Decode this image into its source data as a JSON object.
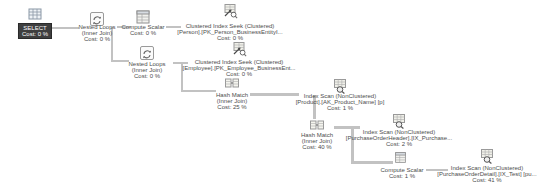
{
  "plan": {
    "colors": {
      "canvas_bg": "#ffffff",
      "connector": "#c2c2c2",
      "selected_bg": "#3f3f3f",
      "selected_text": "#ffffff",
      "label_text": "#4d4d4d"
    },
    "nodes": [
      {
        "id": "select",
        "icon": "result-grid-icon",
        "shape": "grid",
        "selected": true,
        "icon_x": 27,
        "icon_y": 6,
        "label_cx": 35,
        "label_y": 23,
        "lines": [
          "SELECT",
          "Cost: 0 %"
        ]
      },
      {
        "id": "nested-loops-1",
        "icon": "nested-loops-icon",
        "shape": "loops",
        "selected": false,
        "icon_x": 89,
        "icon_y": 11,
        "label_cx": 97,
        "label_y": 24,
        "lines": [
          "Nested Loops",
          "(Inner Join)",
          "Cost: 0 %"
        ]
      },
      {
        "id": "compute-scalar-1",
        "icon": "compute-scalar-icon",
        "shape": "scalar",
        "selected": false,
        "icon_x": 135,
        "icon_y": 9,
        "label_cx": 143,
        "label_y": 24,
        "lines": [
          "Compute Scalar",
          "Cost: 0 %"
        ]
      },
      {
        "id": "clustered-index-seek-person",
        "icon": "clustered-index-seek-icon",
        "shape": "seek",
        "selected": false,
        "icon_x": 222,
        "icon_y": 3,
        "label_cx": 230,
        "label_y": 23,
        "lines": [
          "Clustered Index Seek (Clustered)",
          "[Person].[PK_Person_BusinessEntityI...",
          "Cost: 0 %"
        ]
      },
      {
        "id": "nested-loops-2",
        "icon": "nested-loops-icon",
        "shape": "loops",
        "selected": false,
        "icon_x": 139,
        "icon_y": 45,
        "label_cx": 147,
        "label_y": 61,
        "lines": [
          "Nested Loops",
          "(Inner Join)",
          "Cost: 0 %"
        ]
      },
      {
        "id": "clustered-index-seek-employee",
        "icon": "clustered-index-seek-icon",
        "shape": "seek",
        "selected": false,
        "icon_x": 231,
        "icon_y": 41,
        "label_cx": 239,
        "label_y": 59,
        "lines": [
          "Clustered Index Seek (Clustered)",
          "[Employee].[PK_Employee_BusinessEnt...",
          "Cost: 0 %"
        ]
      },
      {
        "id": "hash-match-1",
        "icon": "hash-match-icon",
        "shape": "hash",
        "selected": false,
        "icon_x": 224,
        "icon_y": 75,
        "label_cx": 232,
        "label_y": 92,
        "lines": [
          "Hash Match",
          "(Inner Join)",
          "Cost: 25 %"
        ]
      },
      {
        "id": "index-scan-product",
        "icon": "index-scan-icon",
        "shape": "scan",
        "selected": false,
        "icon_x": 332,
        "icon_y": 78,
        "label_cx": 340,
        "label_y": 93,
        "lines": [
          "Index Scan (NonClustered)",
          "[Product].[AK_Product_Name] [p]",
          "Cost: 1 %"
        ]
      },
      {
        "id": "hash-match-2",
        "icon": "hash-match-icon",
        "shape": "hash",
        "selected": false,
        "icon_x": 309,
        "icon_y": 117,
        "label_cx": 317,
        "label_y": 132,
        "lines": [
          "Hash Match",
          "(Inner Join)",
          "Cost: 40 %"
        ]
      },
      {
        "id": "index-scan-purchaseorderheader",
        "icon": "index-scan-icon",
        "shape": "scan",
        "selected": false,
        "icon_x": 391,
        "icon_y": 113,
        "label_cx": 399,
        "label_y": 129,
        "lines": [
          "Index Scan (NonClustered)",
          "[PurchaseOrderHeader].[IX_Purchase...",
          "Cost: 2 %"
        ]
      },
      {
        "id": "compute-scalar-2",
        "icon": "compute-scalar-icon",
        "shape": "scalar",
        "selected": false,
        "icon_x": 394,
        "icon_y": 151,
        "label_cx": 402,
        "label_y": 167,
        "lines": [
          "Compute Scalar",
          "Cost: 1 %"
        ]
      },
      {
        "id": "index-scan-purchaseorderdetail",
        "icon": "index-scan-icon",
        "shape": "scan",
        "selected": false,
        "icon_x": 479,
        "icon_y": 148,
        "label_cx": 487,
        "label_y": 165,
        "lines": [
          "Index Scan (NonClustered)",
          "[PurchaseOrderDetail].[IX_Test] [pu...",
          "Cost: 41 %"
        ]
      }
    ],
    "connectors": [
      {
        "x": 46,
        "y": 27,
        "w": 33,
        "h": 2
      },
      {
        "x": 117,
        "y": 26,
        "w": 14,
        "h": 2
      },
      {
        "x": 166,
        "y": 26,
        "w": 15,
        "h": 2
      },
      {
        "x": 111,
        "y": 27,
        "w": 2,
        "h": 35
      },
      {
        "x": 111,
        "y": 60,
        "w": 18,
        "h": 2
      },
      {
        "x": 173,
        "y": 62,
        "w": 15,
        "h": 2
      },
      {
        "x": 181,
        "y": 63,
        "w": 2,
        "h": 29
      },
      {
        "x": 181,
        "y": 90,
        "w": 35,
        "h": 2
      },
      {
        "x": 250,
        "y": 93,
        "w": 49,
        "h": 3
      },
      {
        "x": 313,
        "y": 95,
        "w": 3,
        "h": 24
      },
      {
        "x": 334,
        "y": 126,
        "w": 26,
        "h": 3
      },
      {
        "x": 351,
        "y": 127,
        "w": 3,
        "h": 36
      },
      {
        "x": 351,
        "y": 161,
        "w": 42,
        "h": 3
      },
      {
        "x": 426,
        "y": 169,
        "w": 22,
        "h": 2
      }
    ]
  }
}
